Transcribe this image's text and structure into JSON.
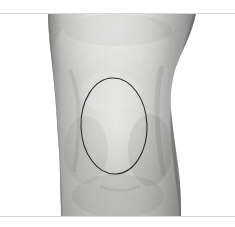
{
  "image": {
    "kind": "clinical-photograph",
    "subject": "knee",
    "view": "anterior",
    "color_mode": "grayscale",
    "width": 235,
    "height": 227,
    "background_color": "#ffffff",
    "letterbox": {
      "top_band_height": 13,
      "bottom_band_height": 11,
      "rule_color": "#d9d9d9"
    }
  },
  "palette": {
    "skin_light": "#d6d6d4",
    "skin_mid": "#bdbdbb",
    "skin_shadow": "#9a9a99",
    "skin_dark_edge": "#7e7e7d",
    "skin_darkest": "#6d6d6c",
    "highlight": "#e3e3e1",
    "annotation_stroke": "#2b2b2b",
    "background": "#ffffff"
  },
  "limb": {
    "name": "leg-silhouette",
    "top_left_x": 48,
    "top_right_x": 196,
    "waist_left_x": 60,
    "waist_right_x": 172,
    "bottom_left_x": 61,
    "bottom_right_x": 181,
    "top_y": 13,
    "bottom_y": 216
  },
  "annotation": {
    "name": "ellipse-marker",
    "shape": "ellipse",
    "center_x": 114,
    "center_y": 126,
    "radius_x": 33,
    "radius_y": 48,
    "rotation_deg": -2,
    "stroke_color": "#2b2b2b",
    "stroke_width": 1.1,
    "fill": "none",
    "label": ""
  },
  "caption": {
    "text": ""
  }
}
